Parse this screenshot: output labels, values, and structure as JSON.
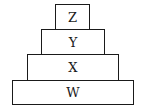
{
  "diagram": {
    "type": "stacked-pyramid",
    "layers": [
      {
        "label": "Z",
        "position": "top"
      },
      {
        "label": "Y",
        "position": "second"
      },
      {
        "label": "X",
        "position": "third"
      },
      {
        "label": "W",
        "position": "bottom"
      }
    ]
  }
}
